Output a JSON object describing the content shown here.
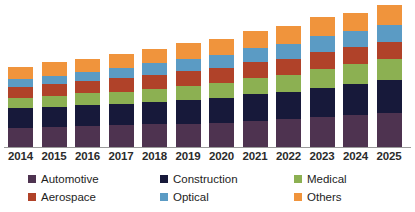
{
  "chart_data": {
    "type": "bar",
    "stacked": true,
    "title": "",
    "subtitle": "",
    "xlabel": "",
    "ylabel": "",
    "grid": false,
    "legend_position": "bottom",
    "axis": {
      "y_axis_visible": false,
      "x_axis_visible": true,
      "ylim": [
        0,
        100
      ]
    },
    "categories": [
      "2014",
      "2015",
      "2016",
      "2017",
      "2018",
      "2019",
      "2020",
      "2021",
      "2022",
      "2023",
      "2024",
      "2025"
    ],
    "series": [
      {
        "name": "Automotive",
        "color": "#4E3350",
        "values": [
          20,
          21,
          22,
          23,
          24,
          25,
          26,
          28,
          30,
          32,
          34,
          36
        ]
      },
      {
        "name": "Construction",
        "color": "#17193A",
        "values": [
          22,
          22,
          23,
          23,
          24,
          25,
          26,
          28,
          29,
          31,
          33,
          35
        ]
      },
      {
        "name": "Medical",
        "color": "#8CB052",
        "values": [
          10,
          11,
          12,
          13,
          14,
          15,
          16,
          17,
          18,
          20,
          21,
          23
        ]
      },
      {
        "name": "Aerospace",
        "color": "#B04229",
        "values": [
          12,
          13,
          13,
          14,
          15,
          16,
          16,
          17,
          17,
          18,
          18,
          18
        ]
      },
      {
        "name": "Optical",
        "color": "#5B9BC4",
        "values": [
          8,
          9,
          10,
          11,
          12,
          13,
          14,
          15,
          16,
          17,
          17,
          18
        ]
      },
      {
        "name": "Others",
        "color": "#F0943C",
        "values": [
          13,
          14,
          14,
          15,
          15,
          17,
          17,
          18,
          19,
          20,
          20,
          21
        ]
      }
    ],
    "stack_totals": [
      85,
      90,
      94,
      99,
      104,
      111,
      115,
      123,
      129,
      138,
      143,
      151
    ],
    "max_total": 151
  },
  "legend": {
    "items": [
      {
        "label": "Automotive",
        "color": "#4E3350",
        "column": 1,
        "row": 1
      },
      {
        "label": "Aerospace",
        "color": "#B04229",
        "column": 1,
        "row": 2
      },
      {
        "label": "Construction",
        "color": "#17193A",
        "column": 2,
        "row": 1
      },
      {
        "label": "Optical",
        "color": "#5B9BC4",
        "column": 2,
        "row": 2
      },
      {
        "label": "Medical",
        "color": "#8CB052",
        "column": 3,
        "row": 1
      },
      {
        "label": "Others",
        "color": "#F0943C",
        "column": 3,
        "row": 2
      }
    ]
  },
  "layout": {
    "bar_width_px": 25,
    "bar_pitch_px": 33.5,
    "first_bar_left_px": 8,
    "plot_height_px": 146,
    "baseline_y_px": 147
  }
}
